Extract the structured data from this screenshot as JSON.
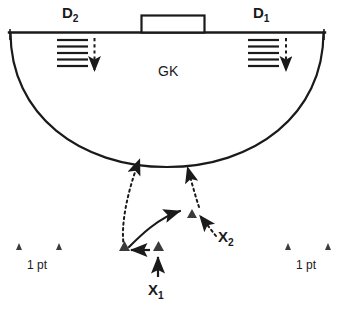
{
  "diagram": {
    "court": {
      "baseline_label": "baseline",
      "goal_label": "goal-box",
      "arc_label": "shooting-arc"
    },
    "labels": {
      "defender_2": "D",
      "defender_2_sub": "2",
      "defender_1": "D",
      "defender_1_sub": "1",
      "goalkeeper": "GK",
      "attacker_1": "X",
      "attacker_1_sub": "1",
      "attacker_2": "X",
      "attacker_2_sub": "2",
      "points_left": "1 pt",
      "points_right": "1 pt"
    },
    "colors": {
      "line": "#1a1a1a",
      "text": "#1a1a1a",
      "background": "#ffffff"
    },
    "markers": {
      "cone_count_left": 2,
      "cone_count_right": 2,
      "cone_count_center": 3,
      "hatch_lines_per_zone": 5
    },
    "arrows": {
      "d2_down": "dashed-down-arrow",
      "d1_down": "dashed-down-arrow",
      "x1_up": "solid-up-arrow",
      "x1_left": "solid-left-arrow",
      "pass_curve": "solid-curved-arrow",
      "run_left": "dotted-arrow-to-arc",
      "run_right": "dotted-arrow-to-arc",
      "x2_in": "dotted-arrow-to-cone"
    }
  }
}
